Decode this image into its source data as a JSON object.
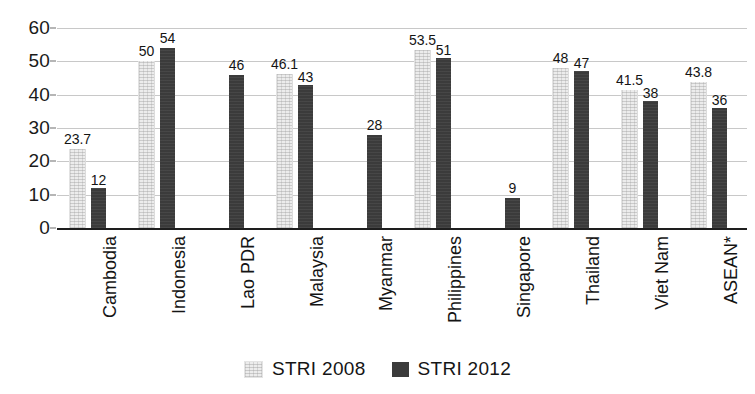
{
  "chart_data": {
    "type": "bar",
    "title": "",
    "subtitle": "",
    "xlabel": "",
    "ylabel": "",
    "ylim": [
      0,
      60
    ],
    "yticks": [
      0,
      10,
      20,
      30,
      40,
      50,
      60
    ],
    "ytick_labels": [
      "0",
      "10",
      "20",
      "30",
      "40",
      "50",
      "60"
    ],
    "grid": true,
    "legend_position": "bottom-center",
    "categories": [
      "Cambodia",
      "Indonesia",
      "Lao PDR",
      "Malaysia",
      "Myanmar",
      "Philippines",
      "Singapore",
      "Thailand",
      "Viet Nam",
      "ASEAN*"
    ],
    "series": [
      {
        "name": "STRI 2008",
        "color": "#ececec",
        "values": [
          23.7,
          50,
          null,
          46.1,
          null,
          53.5,
          null,
          48,
          41.5,
          43.8
        ],
        "labels": [
          "23.7",
          "50",
          "",
          "46.1",
          "",
          "53.5",
          "",
          "48",
          "41.5",
          "43.8"
        ]
      },
      {
        "name": "STRI 2012",
        "color": "#3b3b3b",
        "values": [
          12,
          54,
          46,
          43,
          28,
          51,
          9,
          47,
          38,
          36
        ],
        "labels": [
          "12",
          "54",
          "46",
          "43",
          "28",
          "51",
          "9",
          "47",
          "38",
          "36"
        ]
      }
    ]
  },
  "axis": {
    "y_tick_labels": [
      "60",
      "50",
      "40",
      "30",
      "20",
      "10",
      "0"
    ]
  },
  "legend": {
    "items": [
      {
        "label": "STRI 2008",
        "swatch": "light-gray-swatch"
      },
      {
        "label": "STRI 2012",
        "swatch": "dark-gray-swatch"
      }
    ]
  }
}
